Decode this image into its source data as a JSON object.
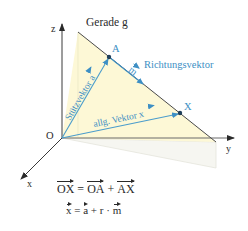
{
  "diagram": {
    "title": "Gerade g",
    "axes": {
      "z_label": "z",
      "y_label": "y",
      "x_label": "x",
      "origin_label": "O"
    },
    "points": {
      "a_label": "A",
      "x_label": "X"
    },
    "vectors": {
      "support_vector_label": "Stützvektor",
      "support_vector_symbol": "a",
      "direction_vector_symbol": "m",
      "direction_vector_label": "Richtungsvektor",
      "general_vector_label": "allg. Vektor",
      "general_vector_symbol": "x"
    },
    "formulas": {
      "line1": {
        "ox": "OX",
        "eq": " = ",
        "oa": "OA",
        "plus": " + ",
        "ax": "AX"
      },
      "line2": {
        "x": "x",
        "eq": " = ",
        "a": "a",
        "plus": " + r · ",
        "m": "m"
      }
    },
    "colors": {
      "axis": "#3a3a3a",
      "line_g": "#4a4a4a",
      "vector_blue": "#4a9ccc",
      "label_blue": "#3d8fc4",
      "plane_fill": "#fdf8d8",
      "shadow_fill": "#f7f7f2",
      "text": "#2a2a2a"
    }
  }
}
